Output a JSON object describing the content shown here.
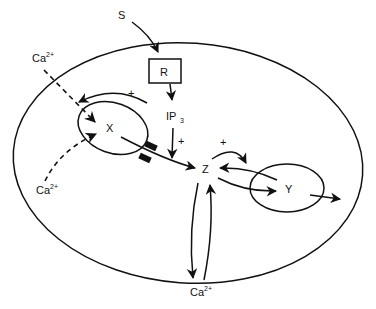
{
  "diagram": {
    "nodes": {
      "signal": {
        "label": "S"
      },
      "receptor": {
        "label": "R"
      },
      "ip3": {
        "label": "IP",
        "sub": "3"
      },
      "x": {
        "label": "X"
      },
      "y": {
        "label": "Y"
      },
      "z": {
        "label": "Z"
      },
      "ca_top": {
        "label": "Ca",
        "sup": "2+"
      },
      "ca_left": {
        "label": "Ca",
        "sup": "2+"
      },
      "ca_bottom": {
        "label": "Ca",
        "sup": "2+"
      }
    },
    "signs": {
      "x_feedback": "+",
      "ip3_to_z": "+",
      "z_to_y": "+"
    },
    "edges": [
      {
        "from": "S",
        "to": "R"
      },
      {
        "from": "R",
        "to": "IP3"
      },
      {
        "from": "IP3",
        "to": "Z",
        "sign": "+"
      },
      {
        "from": "Ca2+ (extracellular, top)",
        "to": "X",
        "style": "dashed"
      },
      {
        "from": "Ca2+ (left)",
        "to": "X",
        "style": "dashed"
      },
      {
        "from": "cytosol",
        "to": "X",
        "sign": "+"
      },
      {
        "from": "X",
        "to": "Z",
        "note": "via channel"
      },
      {
        "from": "Z",
        "to": "Y",
        "sign": "+"
      },
      {
        "from": "Y",
        "to": "Z"
      },
      {
        "from": "Z",
        "to": "Y"
      },
      {
        "from": "Y",
        "to": "outside"
      },
      {
        "from": "Z",
        "to": "Ca2+ (bottom)"
      },
      {
        "from": "Ca2+ (bottom)",
        "to": "Z"
      }
    ]
  }
}
